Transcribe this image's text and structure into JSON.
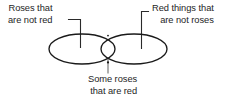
{
  "diagram": {
    "type": "venn-two-set",
    "background_color": "#ffffff",
    "stroke_color": "#1a1a1a",
    "text_color": "#1e1e1e",
    "sets": [
      {
        "id": "roses",
        "label_lines": [
          "Roses that",
          "are not red"
        ],
        "region": "left-only"
      },
      {
        "id": "red-things",
        "label_lines": [
          "Red things that",
          "are not roses"
        ],
        "region": "right-only"
      }
    ],
    "intersection": {
      "id": "red-roses",
      "label_lines": [
        "Some roses",
        "that are red"
      ],
      "region": "overlap"
    },
    "labels": {
      "left": {
        "line1": "Roses that",
        "line2": "are not red"
      },
      "right": {
        "line1": "Red things that",
        "line2": "are not roses"
      },
      "bottom": {
        "line1": "Some roses",
        "line2": "that are red"
      }
    }
  }
}
